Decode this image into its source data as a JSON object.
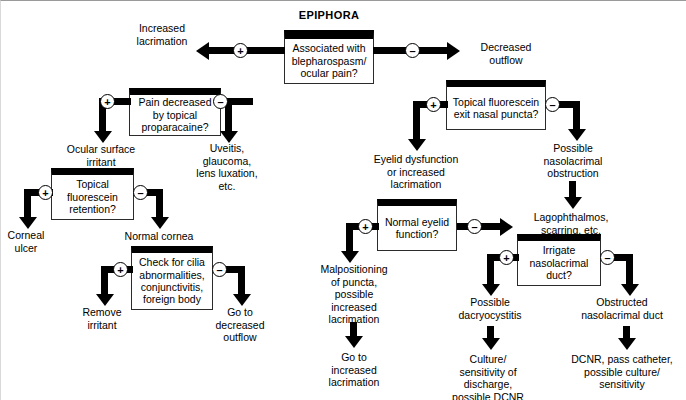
{
  "diagram": {
    "title": "EPIPHORA",
    "boxes": {
      "root": "Associated with\nblepharospasm/\nocular pain?",
      "pain_proparacaine": "Pain decreased\nby topical\nproparacaine?",
      "fluorescein_retention": "Topical\nfluorescein\nretention?",
      "cilia_check": "Check for cilia\nabnormalities,\nconjunctivitis,\nforeign body",
      "fluorescein_exit": "Topical\nfluorescein exit\nnasal puncta?",
      "eyelid_function": "Normal\neyelid\nfunction?",
      "irrigate_duct": "Irrigate\nnasolacrimal\nduct?"
    },
    "labels": {
      "increased_lacrimation": "Increased\nlacrimation",
      "decreased_outflow": "Decreased\noutflow",
      "ocular_surface_irritant": "Ocular surface\nirritant",
      "uveitis": "Uveitis,\nglaucoma,\nlens luxation,\netc.",
      "corneal_ulcer": "Corneal\nulcer",
      "normal_cornea": "Normal cornea",
      "remove_irritant": "Remove\nirritant",
      "go_to_decreased_outflow": "Go to\ndecreased\noutflow",
      "eyelid_dysfunction": "Eyelid dysfunction\nor increased\nlacrimation",
      "possible_nasolacrimal_obstruction": "Possible\nnasolacrimal\nobstruction",
      "lagophthalmos": "Lagophthalmos,\nscarring, etc.",
      "malpositioning": "Malpositioning\nof puncta,\npossible\nincreased\nlacrimation",
      "go_to_increased_lacrimation": "Go to\nincreased\nlacrimation",
      "possible_dacryocystitis": "Possible\ndacryocystitis",
      "culture_sensitivity": "Culture/\nsensitivity of\ndischarge,\npossible DCNR",
      "obstructed_duct": "Obstructed\nnasolacrimal duct",
      "dcnr": "DCNR, pass catheter,\npossible culture/\nsensitivity"
    },
    "signs": {
      "plus": "+",
      "minus": "–"
    },
    "colors": {
      "ink": "#000000",
      "box_fill": "#ffffff",
      "box_border": "#2b2b2b",
      "page": "#ffffff"
    }
  }
}
